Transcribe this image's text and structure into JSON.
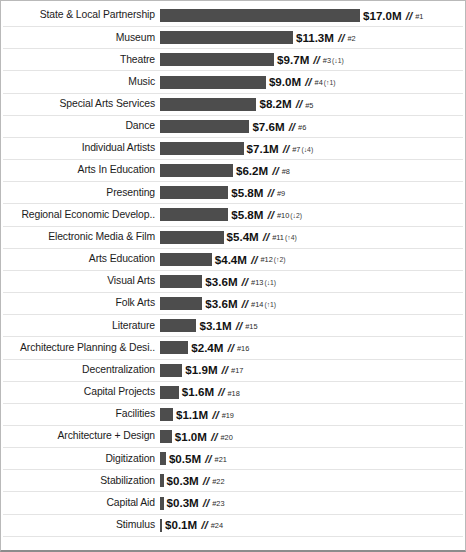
{
  "chart_data": {
    "type": "bar",
    "orientation": "horizontal",
    "title": "",
    "subtitle": "",
    "xlabel": "",
    "ylabel": "",
    "grid": false,
    "legend": "none",
    "units": "$M",
    "xlim": [
      0,
      17.0
    ],
    "value_suffix": "M",
    "value_prefix": "$",
    "rank_separator": "//",
    "rank_prefix": "#",
    "bar_color": "#4d4d4d",
    "row_divider_color": "#e4e4e4",
    "frame_color": "#b9b9b9",
    "categories": [
      "State & Local Partnership",
      "Museum",
      "Theatre",
      "Music",
      "Special Arts Services",
      "Dance",
      "Individual Artists",
      "Arts In Education",
      "Presenting",
      "Regional Economic Develop..",
      "Electronic Media & Film",
      "Arts Education",
      "Visual Arts",
      "Folk Arts",
      "Literature",
      "Architecture Planning & Desi..",
      "Decentralization",
      "Capital Projects",
      "Facilities",
      "Architecture + Design",
      "Digitization",
      "Stabilization",
      "Capital Aid",
      "Stimulus"
    ],
    "values": [
      17.0,
      11.3,
      9.7,
      9.0,
      8.2,
      7.6,
      7.1,
      6.2,
      5.8,
      5.8,
      5.4,
      4.4,
      3.6,
      3.6,
      3.1,
      2.4,
      1.9,
      1.6,
      1.1,
      1.0,
      0.5,
      0.3,
      0.3,
      0.1
    ],
    "value_labels": [
      "$17.0M",
      "$11.3M",
      "$9.7M",
      "$9.0M",
      "$8.2M",
      "$7.6M",
      "$7.1M",
      "$6.2M",
      "$5.8M",
      "$5.8M",
      "$5.4M",
      "$4.4M",
      "$3.6M",
      "$3.6M",
      "$3.1M",
      "$2.4M",
      "$1.9M",
      "$1.6M",
      "$1.1M",
      "$1.0M",
      "$0.5M",
      "$0.3M",
      "$0.3M",
      "$0.1M"
    ],
    "ranks": [
      "#1",
      "#2",
      "#3",
      "#4",
      "#5",
      "#6",
      "#7",
      "#8",
      "#9",
      "#10",
      "#11",
      "#12",
      "#13",
      "#14",
      "#15",
      "#16",
      "#17",
      "#18",
      "#19",
      "#20",
      "#21",
      "#22",
      "#23",
      "#24"
    ],
    "rank_deltas": [
      "",
      "",
      "(↓1)",
      "(↑1)",
      "",
      "",
      "(↓4)",
      "",
      "",
      "(↓2)",
      "(↑4)",
      "(↑2)",
      "(↓1)",
      "(↑1)",
      "",
      "",
      "",
      "",
      "",
      "",
      "",
      "",
      "",
      ""
    ]
  }
}
